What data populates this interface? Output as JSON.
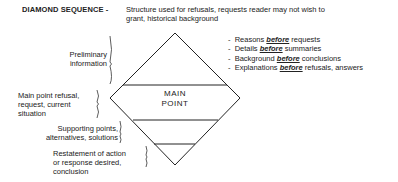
{
  "header": {
    "title": "DIAMOND SEQUENCE -",
    "description": "Structure used for refusals, requests reader may not wish to grant, historical background"
  },
  "diamond": {
    "center_label_line1": "MAIN",
    "center_label_line2": "POINT"
  },
  "left_labels": [
    {
      "line1": "Preliminary",
      "line2": "information"
    },
    {
      "line1": "Main point refusal,",
      "line2": "request, current",
      "line3": "situation"
    },
    {
      "line1": "Supporting points,",
      "line2": "alternatives, solutions"
    },
    {
      "line1": "Restatement of action",
      "line2": "or response desired,",
      "line3": "conclusion"
    }
  ],
  "bullets": [
    {
      "before_kw": "Reasons ",
      "kw": "before",
      "after_kw": " requests"
    },
    {
      "before_kw": "Details ",
      "kw": "before",
      "after_kw": " summaries"
    },
    {
      "before_kw": "Background ",
      "kw": "before",
      "after_kw": " conclusions"
    },
    {
      "before_kw": "Explanations ",
      "kw": "before",
      "after_kw": " refusals, answers"
    }
  ],
  "bullet_marker": "-"
}
